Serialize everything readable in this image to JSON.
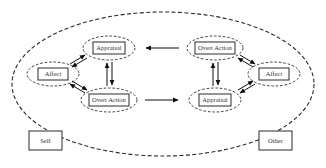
{
  "diagram": {
    "title": "",
    "colors": {
      "stroke": "#2a2a2a",
      "text": "#333333",
      "background": "#ffffff"
    },
    "outer_boundary": {
      "style": "dashed-ellipse"
    },
    "self_side": {
      "appraisal": "Appraisal",
      "affect": "Affect",
      "overt_action": "Overt Action"
    },
    "other_side": {
      "overt_action": "Overt Action",
      "affect": "Affect",
      "appraisal": "Appraisal"
    },
    "labels": {
      "self": "Self",
      "other": "Other"
    },
    "edges": [
      {
        "from": "self.affect",
        "to": "self.appraisal",
        "type": "bidirectional"
      },
      {
        "from": "self.affect",
        "to": "self.overt_action",
        "type": "bidirectional"
      },
      {
        "from": "self.appraisal",
        "to": "self.overt_action",
        "type": "bidirectional"
      },
      {
        "from": "other.affect",
        "to": "other.overt_action",
        "type": "bidirectional"
      },
      {
        "from": "other.affect",
        "to": "other.appraisal",
        "type": "bidirectional"
      },
      {
        "from": "other.overt_action",
        "to": "other.appraisal",
        "type": "bidirectional"
      },
      {
        "from": "other.overt_action",
        "to": "self.appraisal",
        "type": "directed"
      },
      {
        "from": "self.overt_action",
        "to": "other.appraisal",
        "type": "directed"
      }
    ]
  }
}
